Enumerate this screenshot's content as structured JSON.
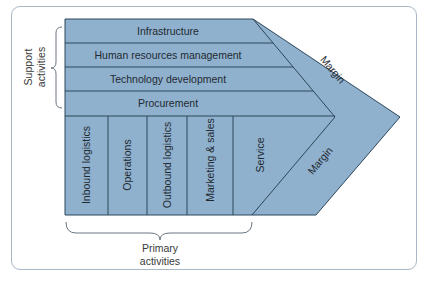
{
  "diagram": {
    "colors": {
      "fill": "#8fb1cd",
      "stroke": "#2c4659",
      "frame": "#a9b8c6",
      "text": "#1f2a33"
    },
    "support_activities": {
      "label_line1": "Support",
      "label_line2": "activities",
      "rows": [
        {
          "label": "Infrastructure"
        },
        {
          "label": "Human resources management"
        },
        {
          "label": "Technology development"
        },
        {
          "label": "Procurement"
        }
      ]
    },
    "primary_activities": {
      "label_line1": "Primary",
      "label_line2": "activities",
      "columns": [
        {
          "label": "Inbound logistics"
        },
        {
          "label": "Operations"
        },
        {
          "label": "Outbound logistics"
        },
        {
          "label": "Marketing & sales"
        },
        {
          "label": "Service"
        }
      ]
    },
    "margin_upper": "Margin",
    "margin_lower": "Margin"
  }
}
